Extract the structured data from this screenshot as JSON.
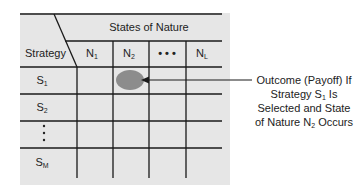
{
  "header": {
    "states_of_nature": "States of Nature",
    "strategy": "Strategy"
  },
  "columns": [
    {
      "base": "N",
      "sub": "1"
    },
    {
      "base": "N",
      "sub": "2"
    },
    {
      "base": "• • •",
      "sub": ""
    },
    {
      "base": "N",
      "sub": "L"
    }
  ],
  "rows": [
    {
      "base": "S",
      "sub": "1"
    },
    {
      "base": "S",
      "sub": "2"
    },
    {
      "base": "⋮",
      "sub": ""
    },
    {
      "base": "S",
      "sub": "M"
    }
  ],
  "annotation": {
    "line1": "Outcome (Payoff) If",
    "line2_a": "Strategy S",
    "line2_sub": "1",
    "line2_b": " Is",
    "line3": "Selected and State",
    "line4_a": "of Nature N",
    "line4_sub": "2",
    "line4_b": " Occurs"
  },
  "colors": {
    "table_bg": "#e6e6e6",
    "grid": "#1a1a1a",
    "highlight": "#8c8c8c"
  }
}
